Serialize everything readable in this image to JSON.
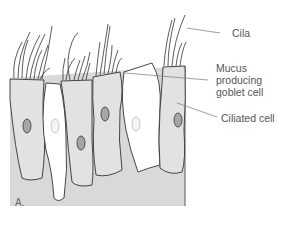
{
  "diagram": {
    "type": "anatomical-illustration",
    "panel_label": "A.",
    "labels": [
      {
        "id": "cilia",
        "text": "Cila"
      },
      {
        "id": "goblet",
        "lines": [
          "Mucus",
          "producing",
          "goblet cell"
        ]
      },
      {
        "id": "ciliated",
        "text": "Ciliated cell"
      }
    ],
    "colors": {
      "tissue": "#d9d9d9",
      "ciliated_cell": "#e2e2e2",
      "goblet_cell": "#ffffff",
      "nucleus": "#a6a6a6",
      "goblet_nucleus": "#f0f0f0",
      "outline": "#333333",
      "leader_line": "#777777"
    }
  }
}
